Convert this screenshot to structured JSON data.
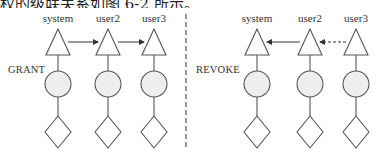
{
  "caption": "权的级联关系如图 6-2 所示。",
  "panels": [
    {
      "id": "grant",
      "side_label": "GRANT",
      "users": [
        "system",
        "user2",
        "user3"
      ],
      "arrows": [
        {
          "from": "system",
          "to": "user2",
          "style": "solid"
        },
        {
          "from": "user2",
          "to": "user3",
          "style": "solid"
        }
      ]
    },
    {
      "id": "revoke",
      "side_label": "REVOKE",
      "users": [
        "system",
        "user2",
        "user3"
      ],
      "arrows": [
        {
          "from": "user2",
          "to": "system",
          "style": "solid"
        },
        {
          "from": "user3",
          "to": "user2",
          "style": "dashed"
        }
      ]
    }
  ],
  "legend_shapes": [
    "triangle",
    "circle",
    "diamond"
  ],
  "colors": {
    "stroke": "#555555",
    "circle_fill": "#eeeeee",
    "text": "#333333"
  }
}
